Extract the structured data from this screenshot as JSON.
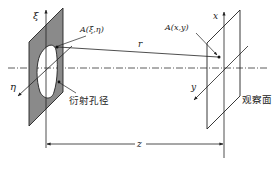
{
  "diagram": {
    "aperture_plane": {
      "label_axis_vertical": "ξ",
      "label_axis_diagonal": "η",
      "point_label": "A(ξ,η)",
      "caption": "衍射孔径",
      "fill_color": "#8a8a8a"
    },
    "observation_plane": {
      "label_axis_vertical": "x",
      "label_axis_diagonal": "y",
      "point_label": "A(x,y)",
      "caption": "观察面"
    },
    "distance_label": "r",
    "separation_label": "z",
    "line_color": "#222222"
  }
}
